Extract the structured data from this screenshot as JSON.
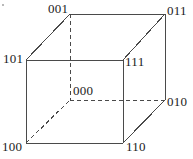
{
  "figure": {
    "kind": "cube-vertex-labeling-diagram",
    "width": 193,
    "height": 159,
    "background_color": "#ffffff",
    "line_color": "#4a4a4a",
    "label_color": "#1b1b1b",
    "line_width": 1,
    "dash_pattern": "4 3"
  },
  "vertices": [
    {
      "id": "001",
      "label": "001",
      "x": 70,
      "y": 14,
      "hidden": false,
      "label_x": 48,
      "label_y": 2
    },
    {
      "id": "011",
      "label": "011",
      "x": 165,
      "y": 14,
      "hidden": false,
      "label_x": 167,
      "label_y": 4
    },
    {
      "id": "101",
      "label": "101",
      "x": 26,
      "y": 60,
      "hidden": false,
      "label_x": 3,
      "label_y": 52
    },
    {
      "id": "111",
      "label": "111",
      "x": 123,
      "y": 60,
      "hidden": false,
      "label_x": 125,
      "label_y": 55
    },
    {
      "id": "000",
      "label": "000",
      "x": 70,
      "y": 100,
      "hidden": true,
      "label_x": 73,
      "label_y": 84
    },
    {
      "id": "010",
      "label": "010",
      "x": 165,
      "y": 100,
      "hidden": false,
      "label_x": 167,
      "label_y": 95
    },
    {
      "id": "100",
      "label": "100",
      "x": 26,
      "y": 143,
      "hidden": false,
      "label_x": 2,
      "label_y": 140
    },
    {
      "id": "110",
      "label": "110",
      "x": 123,
      "y": 143,
      "hidden": false,
      "label_x": 126,
      "label_y": 140
    }
  ],
  "edges": [
    {
      "from": "101",
      "to": "111",
      "style": "solid",
      "name": "edge-101-111"
    },
    {
      "from": "111",
      "to": "110",
      "style": "solid",
      "name": "edge-111-110"
    },
    {
      "from": "110",
      "to": "100",
      "style": "solid",
      "name": "edge-110-100"
    },
    {
      "from": "100",
      "to": "101",
      "style": "solid",
      "name": "edge-100-101"
    },
    {
      "from": "001",
      "to": "011",
      "style": "solid",
      "name": "edge-001-011"
    },
    {
      "from": "011",
      "to": "010",
      "style": "solid",
      "name": "edge-011-010"
    },
    {
      "from": "101",
      "to": "001",
      "style": "solid",
      "name": "edge-101-001"
    },
    {
      "from": "111",
      "to": "011",
      "style": "solid",
      "name": "edge-111-011"
    },
    {
      "from": "110",
      "to": "010",
      "style": "solid",
      "name": "edge-110-010"
    },
    {
      "from": "001",
      "to": "000",
      "style": "dashed",
      "name": "edge-001-000"
    },
    {
      "from": "000",
      "to": "010",
      "style": "dashed",
      "name": "edge-000-010"
    },
    {
      "from": "100",
      "to": "000",
      "style": "dashed",
      "name": "edge-100-000"
    }
  ]
}
